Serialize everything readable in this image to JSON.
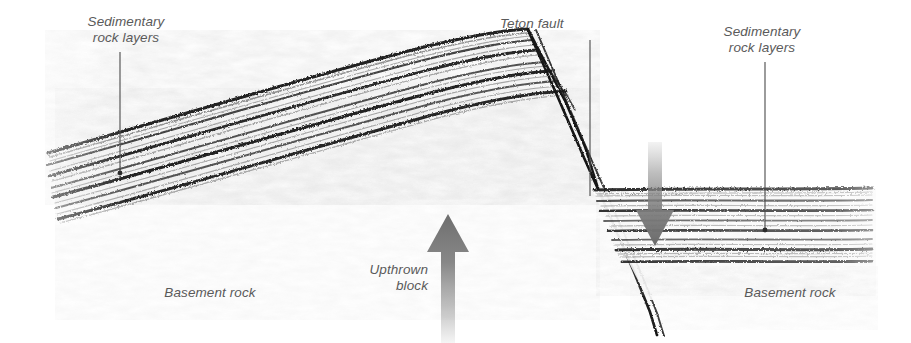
{
  "figure": {
    "background_color": "#ffffff",
    "ink_color": "#1a1a1a",
    "label_color": "#5a5a5a",
    "arrow_color": "#808080"
  },
  "labels": {
    "sedimentary_left": "Sedimentary\nrock layers",
    "teton_fault": "Teton fault",
    "sedimentary_right": "Sedimentary\nrock layers",
    "upthrown_block": "Upthrown\nblock",
    "basement_left": "Basement rock",
    "basement_right": "Basement rock"
  },
  "annotations": {
    "leader_left": {
      "from_x": 120,
      "from_y": 52,
      "to_x": 120,
      "to_y": 173
    },
    "leader_teton": {
      "from_x": 590,
      "from_y": 40,
      "to_x": 590,
      "to_y": 196
    },
    "leader_right": {
      "from_x": 765,
      "from_y": 62,
      "to_x": 765,
      "to_y": 230
    }
  },
  "arrows": {
    "up_arrow": {
      "name": "upthrown-motion-arrow",
      "direction": "up",
      "tip_x": 448,
      "tip_y": 214,
      "base_y": 343,
      "shaft_half_width": 7,
      "head_half_width": 21,
      "head_height": 38,
      "gradient": "dark at tip, fading to light at base"
    },
    "down_arrow": {
      "name": "downthrown-motion-arrow",
      "direction": "down",
      "tip_x": 655,
      "tip_y": 246,
      "base_y": 142,
      "shaft_half_width": 7,
      "head_half_width": 19,
      "head_height": 36,
      "gradient": "light at base, darkening to tip"
    }
  },
  "geology": {
    "footwall": {
      "name": "upthrown-block",
      "apex_x": 528,
      "apex_y": 30,
      "dip_degrees": 16,
      "layer_count": 7,
      "left_edge_x": 45
    },
    "hanging_wall": {
      "name": "downthrown-block",
      "top_y": 188,
      "bottom_y": 263,
      "layer_count": 8,
      "left_edge_x": 592,
      "right_edge_x": 872
    },
    "fault": {
      "name": "teton-fault-plane",
      "top_x": 528,
      "top_y": 30,
      "bottom_x": 648,
      "bottom_y": 343,
      "style": "double line"
    }
  }
}
